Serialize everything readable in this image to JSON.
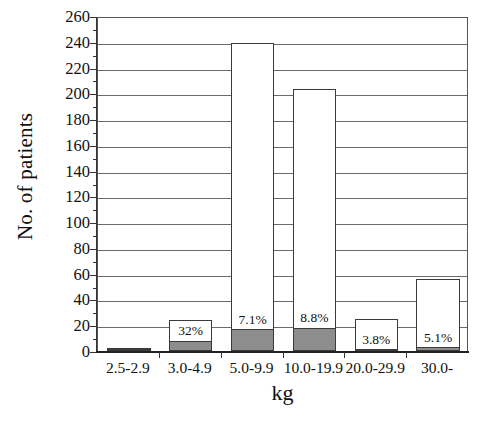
{
  "chart_data": {
    "type": "bar",
    "title": "",
    "subtitle": "",
    "xlabel": "kg",
    "ylabel": "No. of patients",
    "categories": [
      "2.5-2.9",
      "3.0-4.9",
      "5.0-9.9",
      "10.0-19.9",
      "20.0-29.9",
      "30.0-"
    ],
    "ylim": [
      0,
      260
    ],
    "ytick_step": 20,
    "yticks": [
      0,
      20,
      40,
      60,
      80,
      100,
      120,
      140,
      160,
      180,
      200,
      220,
      240,
      260
    ],
    "ytick_labels": [
      "0",
      "20",
      "40",
      "60",
      "80",
      "100",
      "120",
      "140",
      "160",
      "180",
      "200",
      "220",
      "240",
      "260"
    ],
    "grid": true,
    "legend": "none",
    "series": [
      {
        "name": "Total no. of patients",
        "style": "open",
        "values": [
          2,
          24,
          239,
          203,
          25,
          56
        ]
      },
      {
        "name": "Subgroup (shaded)",
        "style": "filled-gray",
        "values": [
          1,
          8,
          17,
          18,
          1,
          3
        ]
      }
    ],
    "annotations": [
      {
        "category": "2.5-2.9",
        "label": ""
      },
      {
        "category": "3.0-4.9",
        "label": "32%"
      },
      {
        "category": "5.0-9.9",
        "label": "7.1%"
      },
      {
        "category": "10.0-19.9",
        "label": "8.8%"
      },
      {
        "category": "20.0-29.9",
        "label": "3.8%"
      },
      {
        "category": "30.0-",
        "label": "5.1%"
      }
    ],
    "colors": {
      "bar_open_fill": "#ffffff",
      "bar_sub_fill": "#8d8d8d",
      "bar_stroke": "#3b3b3b",
      "gridline": "#6b6b6b",
      "axis": "#333333",
      "text": "#111111",
      "background": "#ffffff"
    }
  }
}
